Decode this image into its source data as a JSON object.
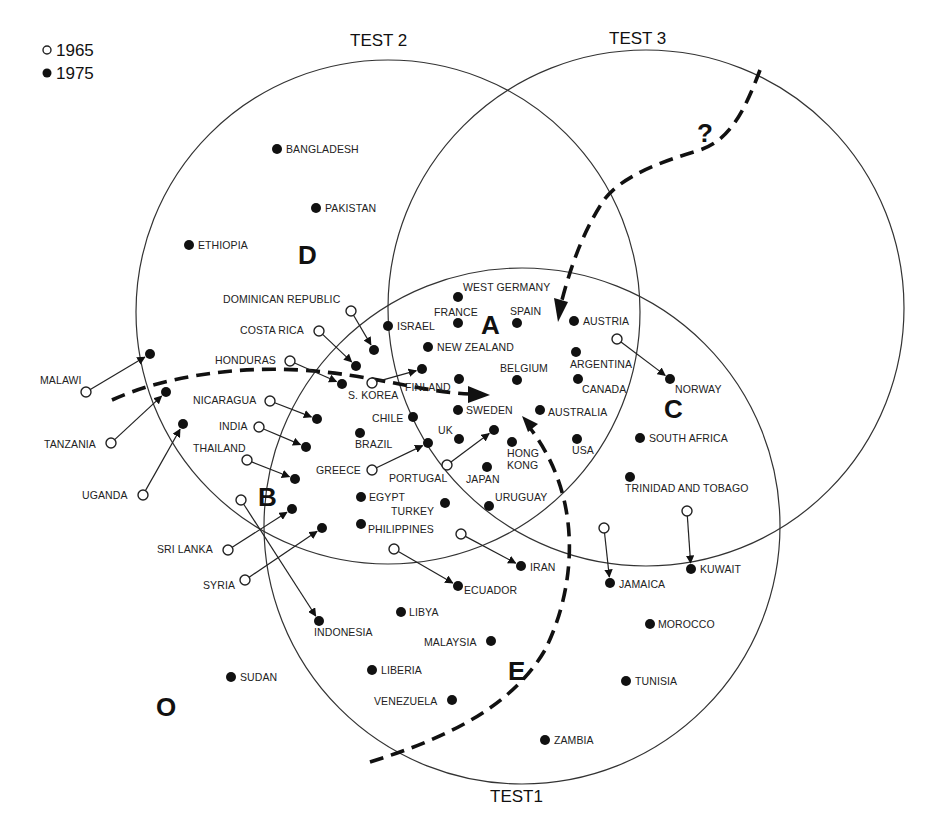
{
  "legend": {
    "items": [
      {
        "symbol": "open-circle",
        "label": "1965"
      },
      {
        "symbol": "filled-circle",
        "label": "1975"
      }
    ]
  },
  "tests": [
    {
      "label": "TEST1",
      "cx": 522,
      "cy": 526,
      "r": 258,
      "label_x": 490,
      "label_y": 802
    },
    {
      "label": "TEST 2",
      "cx": 388,
      "cy": 312,
      "r": 252,
      "label_x": 350,
      "label_y": 46
    },
    {
      "label": "TEST 3",
      "cx": 646,
      "cy": 308,
      "r": 258,
      "label_x": 609,
      "label_y": 44
    }
  ],
  "regions": [
    {
      "label": "A",
      "x": 481,
      "y": 334
    },
    {
      "label": "B",
      "x": 258,
      "y": 506
    },
    {
      "label": "C",
      "x": 664,
      "y": 418
    },
    {
      "label": "D",
      "x": 298,
      "y": 264
    },
    {
      "label": "E",
      "x": 508,
      "y": 680
    },
    {
      "label": "O",
      "x": 156,
      "y": 716
    }
  ],
  "question_mark": {
    "label": "?",
    "x": 697,
    "y": 142
  },
  "dashed_paths": [
    {
      "name": "path-to-A-from-left",
      "d": "M 112 400 C 160 378, 230 366, 300 370 S 420 392, 470 394"
    },
    {
      "name": "path-to-A-from-top",
      "d": "M 760 70 C 745 110, 730 140, 700 150 C 660 162, 622 176, 604 200 C 585 228, 572 262, 562 300"
    },
    {
      "name": "path-E-up-to-A",
      "d": "M 370 762 C 440 740, 510 710, 545 650 C 575 590, 585 500, 530 428"
    }
  ],
  "dashed_arrowheads": [
    {
      "name": "arrowhead-left",
      "points": "468,386 490,395 468,403"
    },
    {
      "name": "arrowhead-top",
      "points": "554,298 568,302 558,322"
    },
    {
      "name": "arrowhead-bottom",
      "points": "522,416 538,424 528,432"
    }
  ],
  "countries_static": [
    {
      "name": "BANGLADESH",
      "x": 277,
      "y": 149,
      "lx": 286,
      "ly": 153,
      "anchor": "start"
    },
    {
      "name": "PAKISTAN",
      "x": 316,
      "y": 208,
      "lx": 325,
      "ly": 212,
      "anchor": "start"
    },
    {
      "name": "ETHIOPIA",
      "x": 189,
      "y": 245,
      "lx": 198,
      "ly": 249,
      "anchor": "start"
    },
    {
      "name": "WEST  GERMANY",
      "x": 458,
      "y": 297,
      "lx": 463,
      "ly": 291,
      "anchor": "start"
    },
    {
      "name": "FRANCE",
      "x": 458,
      "y": 323,
      "lx": 434,
      "ly": 316,
      "anchor": "start"
    },
    {
      "name": "SPAIN",
      "x": 517,
      "y": 323,
      "lx": 510,
      "ly": 315,
      "anchor": "start"
    },
    {
      "name": "AUSTRIA",
      "x": 574,
      "y": 321,
      "lx": 583,
      "ly": 325,
      "anchor": "start"
    },
    {
      "name": "ISRAEL",
      "x": 388,
      "y": 326,
      "lx": 397,
      "ly": 330,
      "anchor": "start"
    },
    {
      "name": "NEW ZEALAND",
      "x": 428,
      "y": 347,
      "lx": 437,
      "ly": 351,
      "anchor": "start"
    },
    {
      "name": "ARGENTINA",
      "x": 576,
      "y": 352,
      "lx": 570,
      "ly": 368,
      "anchor": "start"
    },
    {
      "name": "BELGIUM",
      "x": 517,
      "y": 380,
      "lx": 500,
      "ly": 372,
      "anchor": "start"
    },
    {
      "name": "CANADA",
      "x": 578,
      "y": 379,
      "lx": 582,
      "ly": 393,
      "anchor": "start"
    },
    {
      "name": "FINLAND",
      "x": 459,
      "y": 379,
      "lx": 405,
      "ly": 391,
      "anchor": "start"
    },
    {
      "name": "SWEDEN",
      "x": 458,
      "y": 410,
      "lx": 466,
      "ly": 414,
      "anchor": "start"
    },
    {
      "name": "AUSTRALIA",
      "x": 540,
      "y": 410,
      "lx": 548,
      "ly": 416,
      "anchor": "start"
    },
    {
      "name": "CHILE",
      "x": 413,
      "y": 417,
      "lx": 372,
      "ly": 422,
      "anchor": "start"
    },
    {
      "name": "BRAZIL",
      "x": 360,
      "y": 433,
      "lx": 355,
      "ly": 448,
      "anchor": "start"
    },
    {
      "name": "UK",
      "x": 459,
      "y": 439,
      "lx": 438,
      "ly": 434,
      "anchor": "start"
    },
    {
      "name": "HONG\nKONG",
      "x": 512,
      "y": 442,
      "lx": 507,
      "ly": 457,
      "anchor": "start"
    },
    {
      "name": "USA",
      "x": 577,
      "y": 439,
      "lx": 572,
      "ly": 454,
      "anchor": "start"
    },
    {
      "name": "JAPAN",
      "x": 487,
      "y": 467,
      "lx": 466,
      "ly": 483,
      "anchor": "start"
    },
    {
      "name": "SOUTH AFRICA",
      "x": 640,
      "y": 438,
      "lx": 649,
      "ly": 442,
      "anchor": "start"
    },
    {
      "name": "TRINIDAD AND TOBAGO",
      "x": 630,
      "y": 477,
      "lx": 625,
      "ly": 492,
      "anchor": "start"
    },
    {
      "name": "EGYPT",
      "x": 361,
      "y": 497,
      "lx": 369,
      "ly": 501,
      "anchor": "start"
    },
    {
      "name": "TURKEY",
      "x": 445,
      "y": 503,
      "lx": 391,
      "ly": 515,
      "anchor": "start"
    },
    {
      "name": "URUGUAY",
      "x": 489,
      "y": 506,
      "lx": 495,
      "ly": 501,
      "anchor": "start"
    },
    {
      "name": "PHILIPPINES",
      "x": 361,
      "y": 524,
      "lx": 368,
      "ly": 533,
      "anchor": "start"
    },
    {
      "name": "LIBYA",
      "x": 401,
      "y": 612,
      "lx": 409,
      "ly": 616,
      "anchor": "start"
    },
    {
      "name": "MALAYSIA",
      "x": 491,
      "y": 641,
      "lx": 424,
      "ly": 646,
      "anchor": "start"
    },
    {
      "name": "MOROCCO",
      "x": 650,
      "y": 624,
      "lx": 658,
      "ly": 628,
      "anchor": "start"
    },
    {
      "name": "SUDAN",
      "x": 231,
      "y": 677,
      "lx": 240,
      "ly": 681,
      "anchor": "start"
    },
    {
      "name": "LIBERIA",
      "x": 372,
      "y": 670,
      "lx": 381,
      "ly": 674,
      "anchor": "start"
    },
    {
      "name": "TUNISIA",
      "x": 626,
      "y": 681,
      "lx": 635,
      "ly": 685,
      "anchor": "start"
    },
    {
      "name": "VENEZUELA",
      "x": 452,
      "y": 700,
      "lx": 374,
      "ly": 705,
      "anchor": "start"
    },
    {
      "name": "ZAMBIA",
      "x": 545,
      "y": 740,
      "lx": 554,
      "ly": 744,
      "anchor": "start"
    }
  ],
  "countries_moved": [
    {
      "name": "MALAWI",
      "from": [
        86,
        392
      ],
      "to": [
        150,
        354
      ],
      "lx": 40,
      "ly": 384
    },
    {
      "name": "TANZANIA",
      "from": [
        111,
        443
      ],
      "to": [
        166,
        392
      ],
      "lx": 44,
      "ly": 448
    },
    {
      "name": "UGANDA",
      "from": [
        143,
        495
      ],
      "to": [
        183,
        424
      ],
      "lx": 82,
      "ly": 499
    },
    {
      "name": "DOMINICAN REPUBLIC",
      "from": [
        351,
        311
      ],
      "to": [
        374,
        350
      ],
      "lx": 223,
      "ly": 303
    },
    {
      "name": "COSTA RICA",
      "from": [
        319,
        331
      ],
      "to": [
        356,
        366
      ],
      "lx": 240,
      "ly": 334
    },
    {
      "name": "HONDURAS",
      "from": [
        290,
        361
      ],
      "to": [
        342,
        384
      ],
      "lx": 215,
      "ly": 364
    },
    {
      "name": "S. KOREA",
      "from": [
        372,
        383
      ],
      "to": [
        422,
        369
      ],
      "lx": 348,
      "ly": 399
    },
    {
      "name": "NICARAGUA",
      "from": [
        270,
        401
      ],
      "to": [
        317,
        419
      ],
      "lx": 193,
      "ly": 404
    },
    {
      "name": "INDIA",
      "from": [
        259,
        427
      ],
      "to": [
        306,
        447
      ],
      "lx": 219,
      "ly": 430
    },
    {
      "name": "THAILAND",
      "from": [
        247,
        460
      ],
      "to": [
        295,
        479
      ],
      "lx": 193,
      "ly": 452
    },
    {
      "name": "GREECE",
      "from": [
        372,
        470
      ],
      "to": [
        428,
        443
      ],
      "lx": 316,
      "ly": 474
    },
    {
      "name": "PORTUGAL",
      "from": [
        447,
        465
      ],
      "to": [
        494,
        430
      ],
      "lx": 389,
      "ly": 482
    },
    {
      "name": "NORWAY",
      "from": [
        617,
        339
      ],
      "to": [
        670,
        379
      ],
      "lx": 675,
      "ly": 393
    },
    {
      "name": "SRI LANKA",
      "from": [
        228,
        550
      ],
      "to": [
        292,
        509
      ],
      "lx": 157,
      "ly": 553
    },
    {
      "name": "SYRIA",
      "from": [
        245,
        580
      ],
      "to": [
        322,
        528
      ],
      "lx": 203,
      "ly": 589
    },
    {
      "name": "INDONESIA",
      "from": [
        241,
        500
      ],
      "to": [
        319,
        621
      ],
      "lx": 314,
      "ly": 636
    },
    {
      "name": "IRAN",
      "from": [
        461,
        534
      ],
      "to": [
        521,
        566
      ],
      "lx": 530,
      "ly": 571
    },
    {
      "name": "ECUADOR",
      "from": [
        394,
        549
      ],
      "to": [
        458,
        586
      ],
      "lx": 464,
      "ly": 594
    },
    {
      "name": "JAMAICA",
      "from": [
        604,
        528
      ],
      "to": [
        610,
        583
      ],
      "lx": 619,
      "ly": 588
    },
    {
      "name": "KUWAIT",
      "from": [
        687,
        511
      ],
      "to": [
        691,
        569
      ],
      "lx": 700,
      "ly": 573
    }
  ]
}
